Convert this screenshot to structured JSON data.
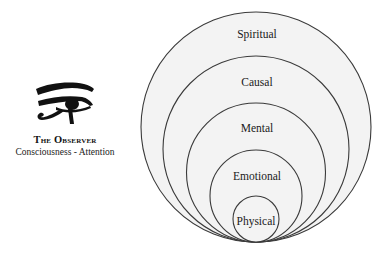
{
  "observer": {
    "icon": "eye-of-horus-icon",
    "title": "The Observer",
    "subtitle": "Consciousness - Attention"
  },
  "diagram": {
    "type": "nested-tangent-circles",
    "colors": {
      "fill": "#f3f3f3",
      "stroke": "#3a3a3a",
      "text": "#1a1a1a"
    },
    "layers": [
      {
        "label": "Spiritual",
        "order": 5
      },
      {
        "label": "Causal",
        "order": 4
      },
      {
        "label": "Mental",
        "order": 3
      },
      {
        "label": "Emotional",
        "order": 2
      },
      {
        "label": "Physical",
        "order": 1
      }
    ]
  }
}
